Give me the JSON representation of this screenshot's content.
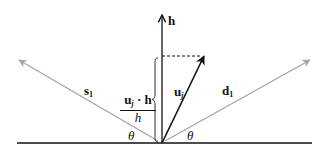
{
  "diagram": {
    "colors": {
      "primary": "#111111",
      "secondary": "#a6a6a6",
      "background": "#ffffff"
    },
    "vectors": {
      "h": {
        "label": "h",
        "style": "bold"
      },
      "u": {
        "label_main": "u",
        "label_sub": "j"
      },
      "s": {
        "label_main": "s",
        "label_sub": "1"
      },
      "d": {
        "label_main": "d",
        "label_sub": "1"
      }
    },
    "projection": {
      "numerator_main": "u",
      "numerator_sub": "j",
      "numerator_op": " · h",
      "denominator": "h"
    },
    "angles": {
      "left": "θ",
      "right": "θ"
    }
  }
}
